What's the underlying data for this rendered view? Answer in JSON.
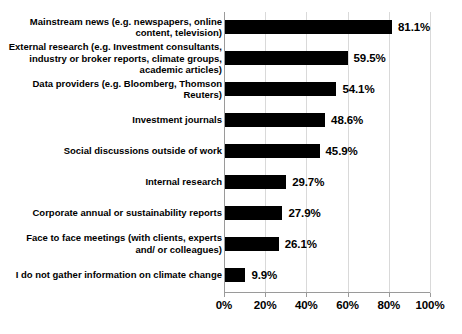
{
  "chart_data": {
    "type": "bar",
    "orientation": "horizontal",
    "title": "",
    "subtitle": "",
    "xlabel": "",
    "ylabel": "",
    "xlim": [
      0,
      100
    ],
    "grid": true,
    "legend": null,
    "value_suffix": "%",
    "categories": [
      "Mainstream news (e.g. newspapers, online content, television)",
      "External research (e.g. Investment consultants, industry or broker reports, climate groups, academic articles)",
      "Data providers (e.g. Bloomberg, Thomson Reuters)",
      "Investment journals",
      "Social discussions outside of work",
      "Internal research",
      "Corporate annual or sustainability reports",
      "Face to face meetings (with clients, experts and/ or colleagues)",
      "I do not gather information on climate change"
    ],
    "values": [
      81.1,
      59.5,
      54.1,
      48.6,
      45.9,
      29.7,
      27.9,
      26.1,
      9.9
    ],
    "value_labels": [
      "81.1%",
      "59.5%",
      "54.1%",
      "48.6%",
      "45.9%",
      "29.7%",
      "27.9%",
      "26.1%",
      "9.9%"
    ],
    "xticks": [
      0,
      20,
      40,
      60,
      80,
      100
    ],
    "xtick_labels": [
      "0%",
      "20%",
      "40%",
      "60%",
      "80%",
      "100%"
    ],
    "colors": {
      "bar": "#000000",
      "background": "#ffffff",
      "gridline": "#d9d9d9",
      "axis": "#9a9a9a",
      "text": "#000000"
    }
  }
}
